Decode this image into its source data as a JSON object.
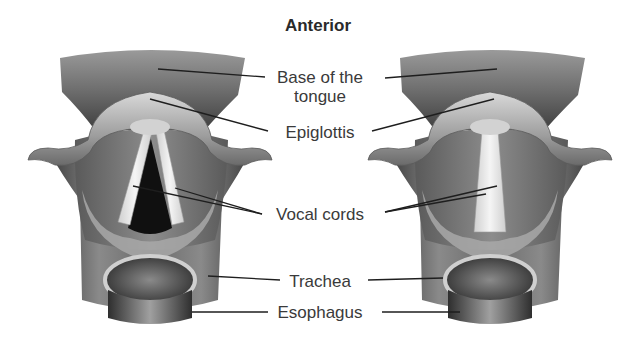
{
  "diagram": {
    "title": "Anterior",
    "views": [
      {
        "name": "left-larynx",
        "vocal_cord_state": "open"
      },
      {
        "name": "right-larynx",
        "vocal_cord_state": "closed"
      }
    ],
    "labels": {
      "base_of_tongue_line1": "Base of the",
      "base_of_tongue_line2": "tongue",
      "epiglottis": "Epiglottis",
      "vocal_cords": "Vocal cords",
      "trachea": "Trachea",
      "esophagus": "Esophagus"
    },
    "colors": {
      "text": "#3a3a3a",
      "leader_line": "#1e1e1e",
      "tissue_dark": "#4a4a4a",
      "tissue_mid": "#8c8c8c",
      "tissue_light": "#c8c8c8",
      "cord": "#ececec",
      "glottis": "#111111"
    }
  }
}
